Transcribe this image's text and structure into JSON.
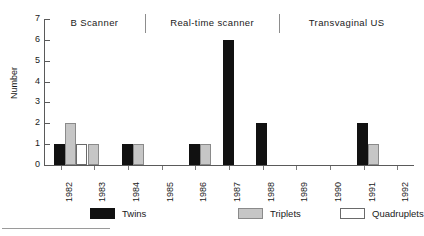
{
  "chart_data": {
    "type": "bar",
    "title": "",
    "xlabel": "",
    "ylabel": "Number",
    "ylim": [
      0,
      7
    ],
    "grid": false,
    "legend_position": "bottom",
    "categories": [
      "1982",
      "1983",
      "1984",
      "1985",
      "1986",
      "1987",
      "1988",
      "1989",
      "1990",
      "1991",
      "1992"
    ],
    "series": [
      {
        "name": "Twins",
        "color": "#111111",
        "values": [
          1,
          0,
          1,
          0,
          1,
          6,
          2,
          0,
          0,
          2,
          0
        ]
      },
      {
        "name": "Triplets",
        "color": "#c6c6c6",
        "values": [
          2,
          1,
          1,
          0,
          1,
          0,
          0,
          0,
          0,
          1,
          0
        ]
      },
      {
        "name": "Quadruplets",
        "color": "#ffffff",
        "values": [
          1,
          0,
          0,
          0,
          0,
          0,
          0,
          0,
          0,
          0,
          0
        ]
      }
    ],
    "y_ticks": [
      "0",
      "1",
      "2",
      "3",
      "4",
      "5",
      "6",
      "7"
    ],
    "annotations": [
      {
        "text": "B  Scanner",
        "covers": [
          "1982",
          "1983",
          "1984"
        ]
      },
      {
        "text": "Real-time  scanner",
        "covers": [
          "1985",
          "1986",
          "1987",
          "1988"
        ]
      },
      {
        "text": "Transvaginal  US",
        "covers": [
          "1989",
          "1990",
          "1991",
          "1992"
        ]
      }
    ]
  },
  "legend": {
    "items": [
      {
        "label": "Twins",
        "swatch": "twins-swatch"
      },
      {
        "label": "Triplets",
        "swatch": "triplets-swatch"
      },
      {
        "label": "Quadruplets",
        "swatch": "quadruplets-swatch"
      }
    ]
  }
}
